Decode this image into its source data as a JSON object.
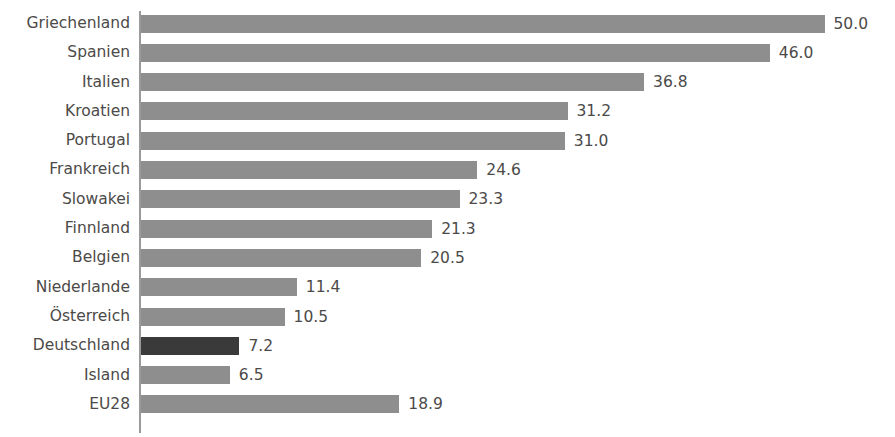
{
  "chart_data": {
    "type": "bar",
    "orientation": "horizontal",
    "title": "",
    "xlabel": "",
    "ylabel": "",
    "grid": false,
    "legend": null,
    "xlim": [
      0,
      55
    ],
    "px_per_unit": 13.67,
    "categories": [
      "Griechenland",
      "Spanien",
      "Italien",
      "Kroatien",
      "Portugal",
      "Frankreich",
      "Slowakei",
      "Finnland",
      "Belgien",
      "Niederlande",
      "Österreich",
      "Deutschland",
      "Island",
      "EU28"
    ],
    "values": [
      50.0,
      46.0,
      36.8,
      31.2,
      31.0,
      24.6,
      23.3,
      21.3,
      20.5,
      11.4,
      10.5,
      7.2,
      6.5,
      18.9
    ],
    "value_labels": [
      "50.0",
      "46.0",
      "36.8",
      "31.2",
      "31.0",
      "24.6",
      "23.3",
      "21.3",
      "20.5",
      "11.4",
      "10.5",
      "7.2",
      "6.5",
      "18.9"
    ],
    "highlight_index": 11,
    "colors": {
      "bar": "#8e8e8e",
      "bar_highlight": "#3a3a3a",
      "text": "#4c4a48",
      "axis": "#9a9a9a",
      "background": "#ffffff"
    }
  }
}
